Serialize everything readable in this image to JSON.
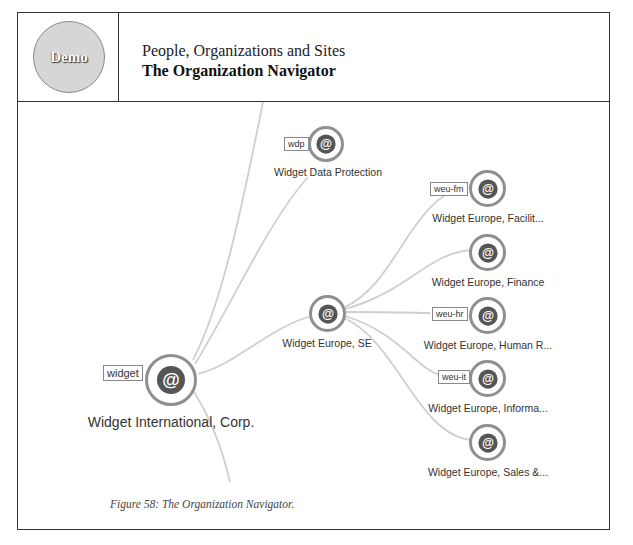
{
  "header": {
    "badge": "Demo",
    "subtitle": "People, Organizations and Sites",
    "title": "The Organization Navigator"
  },
  "caption": "Figure 58: The Organization Navigator.",
  "colors": {
    "edge": "#cfcfcf",
    "node_ring": "#8f8f8f",
    "node_icon": "#555555",
    "badge_fill": "#d6d6d6"
  },
  "graph": {
    "nodes": [
      {
        "id": "root",
        "tag": "widget",
        "label": "Widget International, Corp.",
        "icon": "at-sign-icon"
      },
      {
        "id": "wdp",
        "tag": "wdp",
        "label": "Widget Data Protection",
        "icon": "at-sign-icon"
      },
      {
        "id": "weu",
        "tag": "",
        "label": "Widget Europe, SE",
        "icon": "at-sign-icon"
      },
      {
        "id": "weu-fm",
        "tag": "weu-fm",
        "label": "Widget Europe, Facilit...",
        "icon": "at-sign-icon"
      },
      {
        "id": "weu-fin",
        "tag": "",
        "label": "Widget Europe, Finance",
        "icon": "at-sign-icon"
      },
      {
        "id": "weu-hr",
        "tag": "weu-hr",
        "label": "Widget Europe, Human R...",
        "icon": "at-sign-icon"
      },
      {
        "id": "weu-it",
        "tag": "weu-it",
        "label": "Widget Europe, Informa...",
        "icon": "at-sign-icon"
      },
      {
        "id": "weu-sales",
        "tag": "",
        "label": "Widget Europe, Sales &...",
        "icon": "at-sign-icon"
      }
    ]
  }
}
